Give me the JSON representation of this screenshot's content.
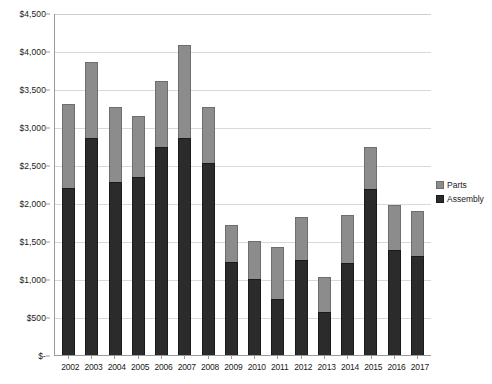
{
  "chart_data": {
    "type": "bar",
    "subtype": "stacked-column",
    "title": "",
    "xlabel": "",
    "ylabel": "",
    "ylim": [
      0,
      4500
    ],
    "ytick_step": 500,
    "grid": true,
    "legend_position": "right",
    "currency_prefix": "$",
    "categories": [
      "2002",
      "2003",
      "2004",
      "2005",
      "2006",
      "2007",
      "2008",
      "2009",
      "2010",
      "2011",
      "2012",
      "2013",
      "2014",
      "2015",
      "2016",
      "2017"
    ],
    "ytick_labels": [
      "$4,500",
      "$4,000",
      "$3,500",
      "$3,000",
      "$2,500",
      "$2,000",
      "$1,500",
      "$1,000",
      "$500",
      "$-"
    ],
    "ytick_values": [
      4500,
      4000,
      3500,
      3000,
      2500,
      2000,
      1500,
      1000,
      500,
      0
    ],
    "series": [
      {
        "name": "Assembly",
        "color": "#2b2b2b",
        "values": [
          2200,
          2850,
          2280,
          2340,
          2740,
          2850,
          2520,
          1220,
          1000,
          740,
          1255,
          565,
          1205,
          2185,
          1380,
          1300
        ]
      },
      {
        "name": "Parts",
        "color": "#8c8c8c",
        "values": [
          1100,
          1000,
          985,
          810,
          860,
          1225,
          740,
          490,
          505,
          680,
          555,
          460,
          635,
          550,
          600,
          590
        ]
      }
    ],
    "totals": [
      3300,
      3850,
      3265,
      3150,
      3600,
      4075,
      3260,
      1710,
      1505,
      1420,
      1810,
      1025,
      1840,
      2735,
      1980,
      1890
    ]
  },
  "legend": {
    "items": [
      {
        "label": "Parts",
        "key": "parts"
      },
      {
        "label": "Assembly",
        "key": "assembly"
      }
    ]
  }
}
